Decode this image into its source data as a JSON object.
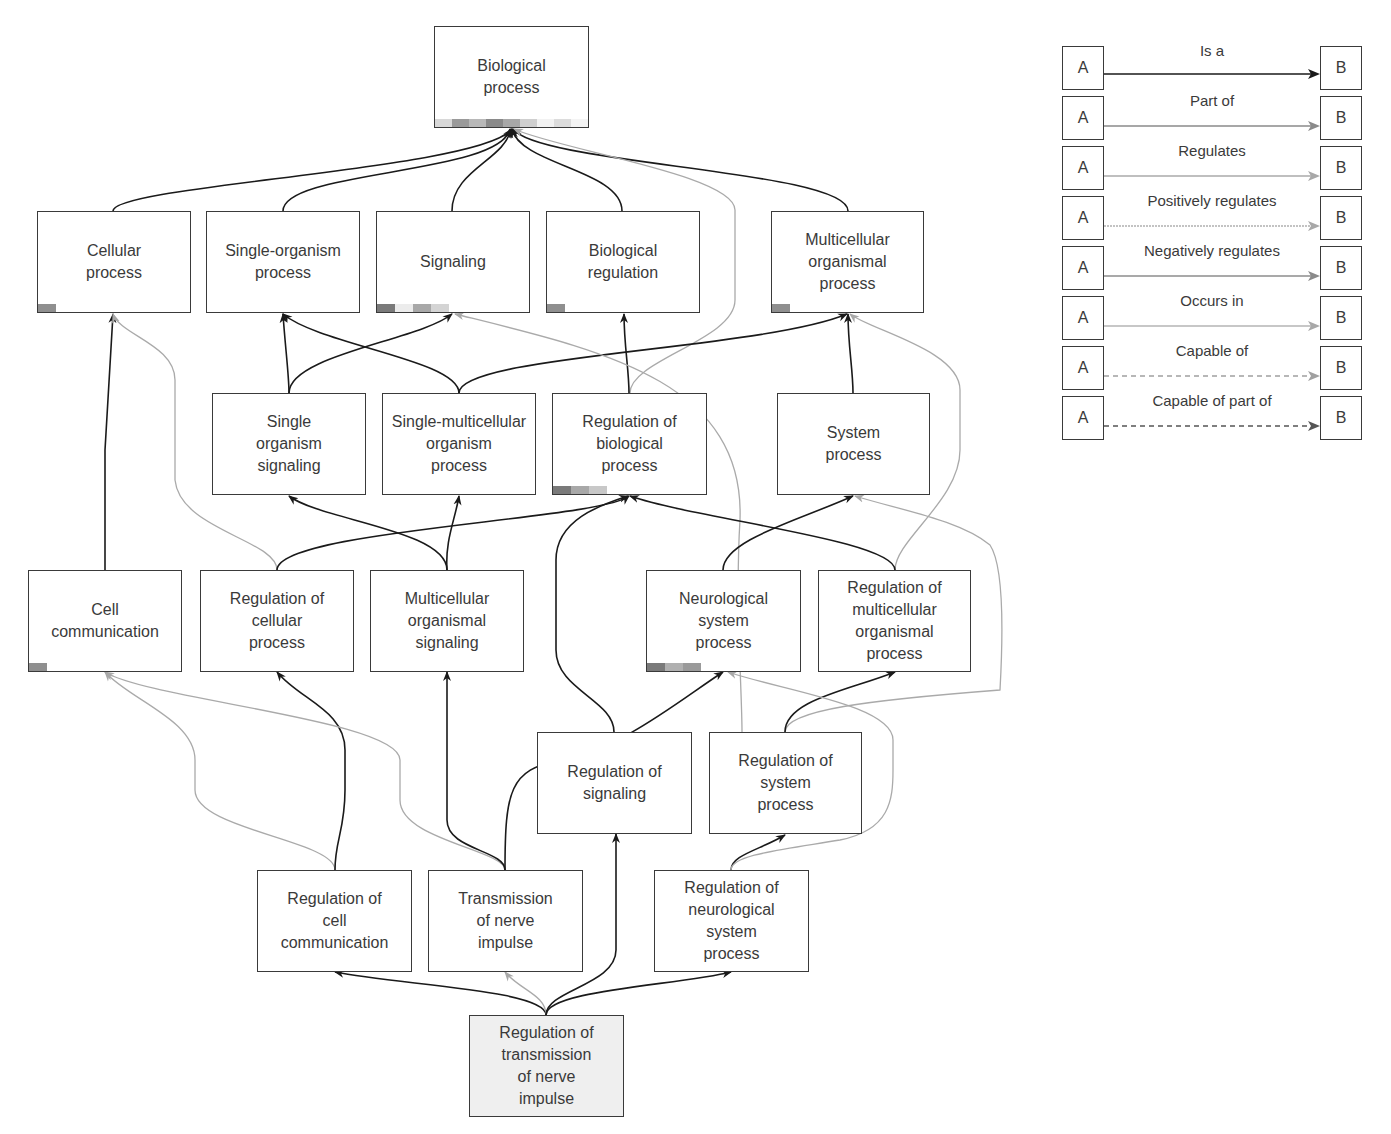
{
  "nodes": [
    {
      "id": "bp",
      "label": "Biological\nprocess",
      "x": 434,
      "y": 26,
      "w": 155,
      "h": 102,
      "bar": [
        "#d8d8d8",
        "#9a9a9a",
        "#b8b8b8",
        "#8a8a8a",
        "#a8a8a8",
        "#cfcfcf",
        "#f2f2f2",
        "#dcdcdc",
        "#f4f4f4"
      ]
    },
    {
      "id": "cp",
      "label": "Cellular\nprocess",
      "x": 37,
      "y": 211,
      "w": 154,
      "h": 102,
      "bar": [
        "#8f8f8f"
      ]
    },
    {
      "id": "sop",
      "label": "Single-organism\nprocess",
      "x": 206,
      "y": 211,
      "w": 154,
      "h": 102,
      "bar": []
    },
    {
      "id": "sig",
      "label": "Signaling",
      "x": 376,
      "y": 211,
      "w": 154,
      "h": 102,
      "bar": [
        "#7a7a7a",
        "#ececec",
        "#a8a8a8",
        "#d4d4d4"
      ]
    },
    {
      "id": "breg",
      "label": "Biological\nregulation",
      "x": 546,
      "y": 211,
      "w": 154,
      "h": 102,
      "bar": [
        "#8f8f8f"
      ]
    },
    {
      "id": "mop",
      "label": "Multicellular\norganismal\nprocess",
      "x": 771,
      "y": 211,
      "w": 153,
      "h": 102,
      "bar": [
        "#8f8f8f"
      ]
    },
    {
      "id": "sos",
      "label": "Single\norganism\nsignaling",
      "x": 212,
      "y": 393,
      "w": 154,
      "h": 102,
      "bar": []
    },
    {
      "id": "smop",
      "label": "Single-multicellular\norganism\nprocess",
      "x": 382,
      "y": 393,
      "w": 154,
      "h": 102,
      "bar": []
    },
    {
      "id": "rbp",
      "label": "Regulation of\nbiological\nprocess",
      "x": 552,
      "y": 393,
      "w": 155,
      "h": 102,
      "bar": [
        "#7a7a7a",
        "#a8a8a8",
        "#c8c8c8"
      ]
    },
    {
      "id": "syp",
      "label": "System\nprocess",
      "x": 777,
      "y": 393,
      "w": 153,
      "h": 102,
      "bar": []
    },
    {
      "id": "cc",
      "label": "Cell\ncommunication",
      "x": 28,
      "y": 570,
      "w": 154,
      "h": 102,
      "bar": [
        "#8f8f8f"
      ]
    },
    {
      "id": "rcp",
      "label": "Regulation of\ncellular\nprocess",
      "x": 200,
      "y": 570,
      "w": 154,
      "h": 102,
      "bar": []
    },
    {
      "id": "mos",
      "label": "Multicellular\norganismal\nsignaling",
      "x": 370,
      "y": 570,
      "w": 154,
      "h": 102,
      "bar": []
    },
    {
      "id": "nsp",
      "label": "Neurological\nsystem\nprocess",
      "x": 646,
      "y": 570,
      "w": 155,
      "h": 102,
      "bar": [
        "#7a7a7a",
        "#b0b0b0",
        "#9a9a9a"
      ]
    },
    {
      "id": "rmop",
      "label": "Regulation of\nmulticellular\norganismal\nprocess",
      "x": 818,
      "y": 570,
      "w": 153,
      "h": 102,
      "bar": []
    },
    {
      "id": "rsig",
      "label": "Regulation of\nsignaling",
      "x": 537,
      "y": 732,
      "w": 155,
      "h": 102,
      "bar": []
    },
    {
      "id": "rsp",
      "label": "Regulation of\nsystem\nprocess",
      "x": 709,
      "y": 732,
      "w": 153,
      "h": 102,
      "bar": []
    },
    {
      "id": "rcc",
      "label": "Regulation of\ncell\ncommunication",
      "x": 257,
      "y": 870,
      "w": 155,
      "h": 102,
      "bar": []
    },
    {
      "id": "tni",
      "label": "Transmission\nof nerve\nimpulse",
      "x": 428,
      "y": 870,
      "w": 155,
      "h": 102,
      "bar": []
    },
    {
      "id": "rnsp",
      "label": "Regulation of\nneurological\nsystem\nprocess",
      "x": 654,
      "y": 870,
      "w": 155,
      "h": 102,
      "bar": []
    },
    {
      "id": "rtni",
      "label": "Regulation of\ntransmission\nof nerve\nimpulse",
      "x": 469,
      "y": 1015,
      "w": 155,
      "h": 102,
      "bar": [],
      "shaded": true
    }
  ],
  "edges": [
    {
      "d": "M113,211 C113,185 480,170 512,129",
      "type": "is_a"
    },
    {
      "d": "M283,211 C283,170 500,175 510,129",
      "type": "is_a"
    },
    {
      "d": "M452,211 C452,170 505,160 511,129",
      "type": "is_a"
    },
    {
      "d": "M622,211 C622,170 520,165 512,129",
      "type": "is_a"
    },
    {
      "d": "M848,211 C848,170 540,165 513,129",
      "type": "is_a"
    },
    {
      "d": "M630,393 C630,360 735,340 735,300 L735,210 C735,175 560,150 514,129",
      "type": "regulates"
    },
    {
      "d": "M289,393 C289,375 285,345 283,314",
      "type": "is_a"
    },
    {
      "d": "M289,393 C289,355 420,340 452,314",
      "type": "is_a"
    },
    {
      "d": "M459,393 C459,360 320,345 283,314",
      "type": "is_a"
    },
    {
      "d": "M459,393 C459,355 760,350 847,314",
      "type": "is_a"
    },
    {
      "d": "M629,393 C629,370 624,345 624,314",
      "type": "is_a"
    },
    {
      "d": "M853,393 C853,370 848,345 848,314",
      "type": "is_a"
    },
    {
      "d": "M742,732 C742,690 735,600 740,520 C745,380 600,350 455,314",
      "type": "regulates"
    },
    {
      "d": "M895,570 C895,540 960,500 960,450 L960,390 C960,350 870,330 850,314",
      "type": "regulates"
    },
    {
      "d": "M105,570 L105,450 L113,314",
      "type": "is_a"
    },
    {
      "d": "M277,570 C277,540 180,530 175,480 L175,380 C175,345 120,335 113,314",
      "type": "regulates"
    },
    {
      "d": "M277,570 C277,530 600,520 629,496",
      "type": "is_a"
    },
    {
      "d": "M447,570 C447,530 320,520 289,496",
      "type": "is_a"
    },
    {
      "d": "M447,570 C445,540 455,520 459,496",
      "type": "is_a"
    },
    {
      "d": "M723,570 C723,540 800,520 853,496",
      "type": "is_a"
    },
    {
      "d": "M895,570 C895,540 700,520 630,496",
      "type": "is_a"
    },
    {
      "d": "M614,732 C614,700 556,690 556,650 L556,560 C556,520 600,505 628,496",
      "type": "is_a"
    },
    {
      "d": "M785,732 C785,710 870,700 1000,690 C1005,600 1000,560 990,545 C960,520 900,510 855,496",
      "type": "regulates"
    },
    {
      "d": "M335,870 C335,840 195,830 195,790 L195,760 C195,720 130,700 105,672",
      "type": "regulates"
    },
    {
      "d": "M335,870 C335,840 345,830 345,790 L345,750 C345,710 300,700 277,672",
      "type": "is_a"
    },
    {
      "d": "M505,870 C505,850 400,840 400,800 L400,760 C400,720 150,700 105,672",
      "type": "regulates"
    },
    {
      "d": "M505,870 C505,850 447,850 447,820 L447,672",
      "type": "is_a"
    },
    {
      "d": "M505,870 C505,790 510,770 560,760 C620,750 680,700 723,672",
      "type": "is_a"
    },
    {
      "d": "M614,732 C614,650 640,640 735,625 C760,620 760,590 725,672",
      "type": "none"
    },
    {
      "d": "M785,732 C785,700 850,690 895,672",
      "type": "is_a"
    },
    {
      "d": "M893,870 C893,820 893,760 890,730 C880,700 780,690 730,672",
      "type": "none"
    },
    {
      "d": "M731,870 C731,855 760,850 785,835",
      "type": "is_a"
    },
    {
      "d": "M731,870 C731,855 780,850 840,840 C890,830 893,800 893,770 L893,740 C893,705 780,690 728,672",
      "type": "regulates"
    },
    {
      "d": "M546,1015 C546,990 400,985 335,972",
      "type": "is_a"
    },
    {
      "d": "M546,1015 C546,995 520,990 505,972",
      "type": "regulates"
    },
    {
      "d": "M546,1015 C546,990 616,985 616,950 L616,834",
      "type": "is_a"
    },
    {
      "d": "M546,1015 C546,990 680,985 731,972",
      "type": "is_a"
    }
  ],
  "legend": [
    {
      "a": "A",
      "b": "B",
      "label": "Is a",
      "style": "is_a",
      "y": 46
    },
    {
      "a": "A",
      "b": "B",
      "label": "Part of",
      "style": "part_of",
      "y": 96
    },
    {
      "a": "A",
      "b": "B",
      "label": "Regulates",
      "style": "regulates",
      "y": 146
    },
    {
      "a": "A",
      "b": "B",
      "label": "Positively regulates",
      "style": "pos_reg",
      "y": 196
    },
    {
      "a": "A",
      "b": "B",
      "label": "Negatively regulates",
      "style": "neg_reg",
      "y": 246
    },
    {
      "a": "A",
      "b": "B",
      "label": "Occurs in",
      "style": "occurs_in",
      "y": 296
    },
    {
      "a": "A",
      "b": "B",
      "label": "Capable of",
      "style": "capable_of",
      "y": 346
    },
    {
      "a": "A",
      "b": "B",
      "label": "Capable of part of",
      "style": "capable_part_of",
      "y": 396
    }
  ],
  "colors": {
    "is_a": "#1a1a1a",
    "part_of": "#8a8a8a",
    "regulates": "#aaaaaa",
    "pos_reg": "#b0b0b0",
    "neg_reg": "#8c8c8c",
    "occurs_in": "#b4b4b4",
    "capable_of": "#a0a0a0",
    "capable_part_of": "#555555",
    "node_border": "#3a3a3a",
    "highlight_node_bg": "#efefef"
  }
}
